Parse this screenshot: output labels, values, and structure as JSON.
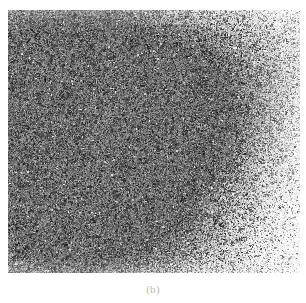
{
  "figure": {
    "panel_label": "(b)",
    "kind": "grayscale-micrograph",
    "scale_annotation": "μm",
    "plate": {
      "x": 8,
      "y": 10,
      "width": 292,
      "height": 263
    },
    "colors": {
      "page_background": "#ffffff",
      "plate_light": "#f4f4f4",
      "plate_mid": "#8f8f8f",
      "plate_dark": "#1e1e1e",
      "caption_text": "#b9b9b9",
      "annotation_text": "#2a2a2a"
    },
    "texture": {
      "description": "fine high-contrast speckle grain",
      "seed": 20240517,
      "grain_count": 52000,
      "cluster_count": 1400,
      "density_gradient": "dark at left and centre, fading to light at right",
      "brightness_field": [
        {
          "cx": 0.18,
          "cy": 0.22,
          "radius": 0.46,
          "darkness": 0.82
        },
        {
          "cx": 0.34,
          "cy": 0.48,
          "radius": 0.52,
          "darkness": 0.95
        },
        {
          "cx": 0.16,
          "cy": 0.74,
          "radius": 0.44,
          "darkness": 0.88
        },
        {
          "cx": 0.52,
          "cy": 0.4,
          "radius": 0.4,
          "darkness": 0.7
        },
        {
          "cx": 0.46,
          "cy": 0.72,
          "radius": 0.34,
          "darkness": 0.58
        },
        {
          "cx": 0.72,
          "cy": 0.3,
          "radius": 0.3,
          "darkness": 0.3
        },
        {
          "cx": 0.86,
          "cy": 0.62,
          "radius": 0.32,
          "darkness": 0.18
        },
        {
          "cx": 0.9,
          "cy": 0.12,
          "radius": 0.26,
          "darkness": 0.14
        }
      ]
    }
  }
}
